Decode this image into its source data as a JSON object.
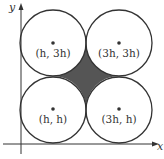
{
  "axes": {
    "x_label": "x",
    "y_label": "y"
  },
  "circles": [
    {
      "label": "(h, 3h)",
      "cx": 53,
      "cy": 43
    },
    {
      "label": "(3h, 3h)",
      "cx": 119,
      "cy": 43
    },
    {
      "label": "(h, h)",
      "cx": 53,
      "cy": 110
    },
    {
      "label": "(3h, h)",
      "cx": 119,
      "cy": 110
    }
  ],
  "radius": 33,
  "colors": {
    "stroke": "#333333",
    "shaded_region": "#555555"
  }
}
